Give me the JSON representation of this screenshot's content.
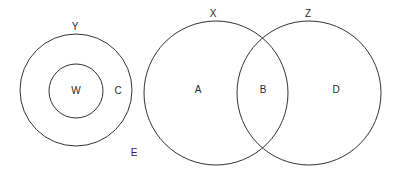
{
  "diagram": {
    "type": "venn",
    "stroke_color": "#333333",
    "background": "#ffffff",
    "sets": [
      {
        "id": "Y",
        "label": "Y",
        "cx": 76,
        "cy": 90,
        "r": 56,
        "label_x": 75,
        "label_y": 27
      },
      {
        "id": "W",
        "label": "W",
        "cx": 76,
        "cy": 91,
        "r": 27,
        "label_x": 76,
        "label_y": 91
      },
      {
        "id": "X",
        "label": "X",
        "cx": 216,
        "cy": 93,
        "r": 72,
        "label_x": 213,
        "label_y": 14
      },
      {
        "id": "Z",
        "label": "Z",
        "cx": 309,
        "cy": 93,
        "r": 72,
        "label_x": 308,
        "label_y": 14
      }
    ],
    "regions": [
      {
        "id": "C",
        "label": "C",
        "x": 118,
        "y": 91
      },
      {
        "id": "A",
        "label": "A",
        "x": 198,
        "y": 90
      },
      {
        "id": "B",
        "label": "B",
        "x": 263,
        "y": 90
      },
      {
        "id": "D",
        "label": "D",
        "x": 336,
        "y": 90
      },
      {
        "id": "E",
        "label": "E",
        "x": 134,
        "y": 153
      }
    ]
  }
}
